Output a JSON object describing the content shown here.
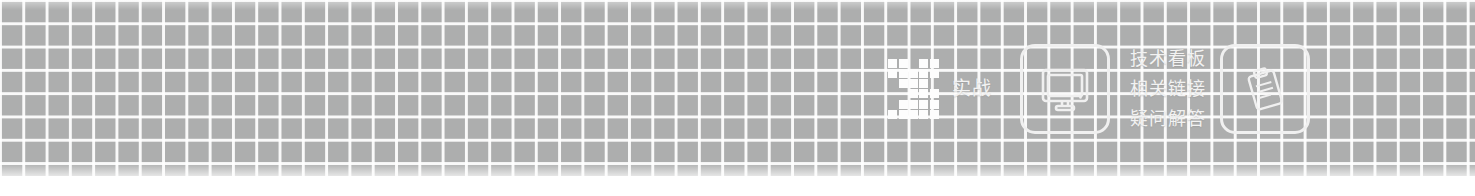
{
  "banner": {
    "background_color": "#adaeae",
    "grid_line_color": "#ffffff",
    "foreground_color": "#f2f2f2",
    "grid_cell_px": 23
  },
  "logo": {
    "name": "pixel-mosaic-logo",
    "blocks": [
      [
        1,
        0
      ],
      [
        2,
        0
      ],
      [
        4,
        0
      ],
      [
        5,
        0
      ],
      [
        1,
        1
      ],
      [
        2,
        1
      ],
      [
        3,
        1
      ],
      [
        4,
        1
      ],
      [
        5,
        1
      ],
      [
        2,
        2
      ],
      [
        3,
        2
      ],
      [
        4,
        2
      ],
      [
        3,
        3
      ],
      [
        4,
        3
      ],
      [
        5,
        3
      ],
      [
        2,
        4
      ],
      [
        3,
        4
      ],
      [
        4,
        4
      ],
      [
        5,
        4
      ],
      [
        1,
        5
      ],
      [
        2,
        5
      ],
      [
        3,
        5
      ],
      [
        4,
        5
      ],
      [
        5,
        5
      ]
    ]
  },
  "items": {
    "practice_label": "实战",
    "monitor_icon": "monitor-icon",
    "clipboard_icon": "clipboard-icon"
  },
  "links": [
    {
      "label": "技术看板"
    },
    {
      "label": "相关链接"
    },
    {
      "label": "疑问解答"
    }
  ]
}
